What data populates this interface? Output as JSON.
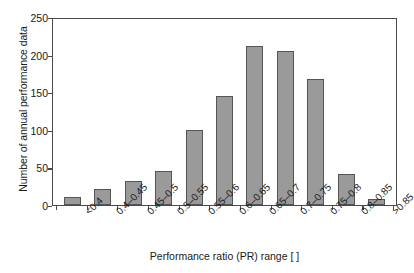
{
  "chart_data": {
    "type": "bar",
    "title": "",
    "xlabel": "Performance ratio (PR) range [ ]",
    "ylabel": "Number of annual performance data",
    "categories": [
      "<0.4",
      "0.4–0.45",
      "0.45–0.5",
      "0.5–0.55",
      "0.55–0.6",
      "0.6–0.65",
      "0.65–0.7",
      "0.7–0.75",
      "0.75–0.8",
      "0.8–0.85",
      ">0.85"
    ],
    "values": [
      11,
      21,
      32,
      45,
      100,
      145,
      212,
      205,
      167,
      41,
      8
    ],
    "ylim": [
      0,
      250
    ],
    "yticks": [
      0,
      50,
      100,
      150,
      200,
      250
    ],
    "ytick_labels": [
      "0",
      "50",
      "100",
      "150",
      "200",
      "250"
    ],
    "grid": false,
    "legend": null,
    "bar_color": "#9a9a9a",
    "bar_edge_color": "#555555",
    "axis_color": "#4a4a4a",
    "background": "#ffffff"
  }
}
